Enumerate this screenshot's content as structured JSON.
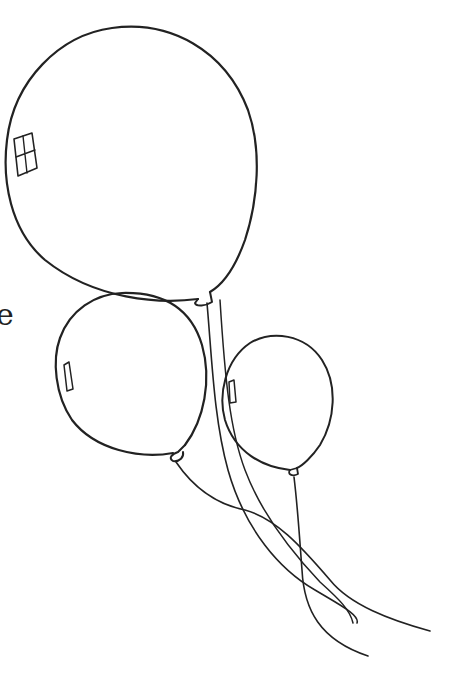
{
  "image": {
    "subject": "Three balloons with trailing strings (line drawing / coloring page)",
    "style": "black outline on white",
    "colors": {
      "line": "#222222",
      "background": "#ffffff"
    },
    "clipped_text_fragment": "e"
  },
  "balloons": [
    {
      "name": "large-balloon",
      "highlight": "window-shaped highlight"
    },
    {
      "name": "medium-balloon",
      "highlight": "rounded rectangle highlight"
    },
    {
      "name": "small-balloon",
      "highlight": "rounded rectangle highlight"
    }
  ]
}
